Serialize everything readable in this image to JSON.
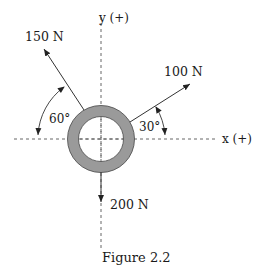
{
  "figure": {
    "caption": "Figure 2.2",
    "axes": {
      "x_label": "x (+)",
      "y_label": "y (+)"
    },
    "forces": [
      {
        "id": "f1",
        "label": "150 N",
        "magnitude": 150,
        "unit": "N",
        "angle_label": "60°",
        "angle_reference": "negative x-axis, measured upward"
      },
      {
        "id": "f2",
        "label": "100 N",
        "magnitude": 100,
        "unit": "N",
        "angle_label": "30°",
        "angle_reference": "positive x-axis, measured upward"
      },
      {
        "id": "f3",
        "label": "200 N",
        "magnitude": 200,
        "unit": "N",
        "direction": "straight down (negative y)"
      }
    ],
    "body": "ring",
    "colors": {
      "ring_fill": "#9a9a9a",
      "lines": "#333333",
      "text": "#1a1a1a"
    }
  }
}
